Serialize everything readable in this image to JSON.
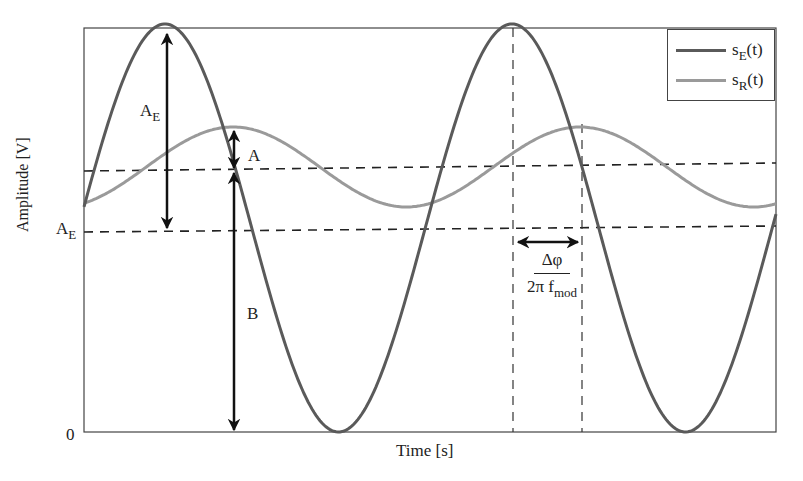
{
  "chart_data": {
    "type": "line",
    "title": "",
    "xlabel": "Time [s]",
    "ylabel": "Amplitude [V]",
    "y_tick_labels": [
      "0"
    ],
    "grid": false,
    "legend_position": "upper right",
    "series": [
      {
        "name": "s_E(t)",
        "label_main": "s",
        "label_sub": "E",
        "label_tail": "(t)",
        "color": "#5a5a5a",
        "description": "emitted signal, large amplitude sinusoid from 0 to 2A_E",
        "center_px": 228,
        "amplitude_px": 204,
        "period_px": 347,
        "peak_x_px": 165
      },
      {
        "name": "s_R(t)",
        "label_main": "s",
        "label_sub": "R",
        "label_tail": "(t)",
        "color": "#9a9a9a",
        "description": "received signal, attenuated and phase-shifted sinusoid",
        "center_px": 167,
        "amplitude_px": 40,
        "period_px": 347,
        "peak_x_px": 233
      }
    ],
    "annotations": [
      {
        "type": "double-arrow-vertical",
        "label": "A_E",
        "meaning": "amplitude of emitted signal"
      },
      {
        "type": "double-arrow-vertical",
        "label": "A",
        "meaning": "amplitude of received signal"
      },
      {
        "type": "double-arrow-vertical",
        "label": "B",
        "meaning": "offset of received signal"
      },
      {
        "type": "double-arrow-horizontal",
        "label": "Δφ / (2π f_mod)",
        "meaning": "time delay from phase shift"
      }
    ]
  },
  "axes": {
    "xlabel": "Time [s]",
    "ylabel": "Amplitude [V]",
    "zero_tick": "0"
  },
  "labels": {
    "ae_top_main": "A",
    "ae_top_sub": "E",
    "ae_left_main": "A",
    "ae_left_sub": "E",
    "a_label": "A",
    "b_label": "B",
    "frac_num": "Δφ",
    "frac_den_main": "2π f",
    "frac_den_sub": "mod"
  },
  "legend": {
    "items": [
      {
        "main": "s",
        "sub": "E",
        "tail": "(t)",
        "color": "#5a5a5a"
      },
      {
        "main": "s",
        "sub": "R",
        "tail": "(t)",
        "color": "#9a9a9a"
      }
    ]
  }
}
